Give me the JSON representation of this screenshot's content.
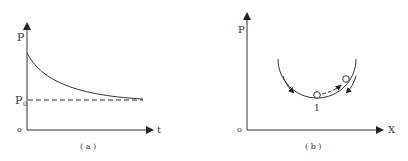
{
  "panel_a": {
    "y_label": "P",
    "x_label": "t",
    "origin_label": "o",
    "baseline_label": "P",
    "baseline_subscript": "0",
    "caption": "( a )",
    "curve_desc": "decaying curve approaching P0"
  },
  "panel_b": {
    "y_label": "P",
    "x_label": "X",
    "origin_label": "o",
    "point_label": "1",
    "caption": "( b )",
    "curve_desc": "U-shaped potential well with ball at bottom and ball on right slope"
  },
  "colors": {
    "line": "#333333",
    "background": "#ffffff"
  }
}
